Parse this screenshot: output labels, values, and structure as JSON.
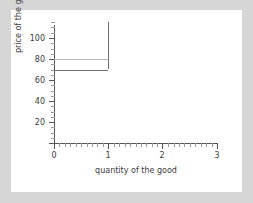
{
  "figure": {
    "background_color": "#d6d6d6",
    "panel_color": "#ffffff"
  },
  "chart_data": {
    "type": "line",
    "title": "",
    "xlabel": "quantity of the good",
    "ylabel": "price of the good",
    "xlim": [
      0,
      3
    ],
    "ylim": [
      0,
      115
    ],
    "xticks": [
      0,
      1,
      2,
      3
    ],
    "xtick_labels": [
      "0",
      "1",
      "2",
      "3"
    ],
    "yticks": [
      20,
      40,
      60,
      80,
      100
    ],
    "ytick_labels": [
      "20",
      "40",
      "60",
      "80",
      "100"
    ],
    "grid": false,
    "legend": null,
    "series": [
      {
        "name": "demand",
        "color": "#b9b9b9",
        "style": "step",
        "points": [
          [
            0,
            80
          ],
          [
            1,
            80
          ]
        ],
        "values": [
          80,
          80
        ]
      },
      {
        "name": "supply",
        "color": "#6e6e6e",
        "style": "step",
        "points": [
          [
            0,
            70
          ],
          [
            1,
            70
          ],
          [
            1,
            115
          ]
        ],
        "values": [
          70,
          70,
          115
        ]
      }
    ],
    "annotations": []
  },
  "axes": {
    "x_title": "quantity of the good",
    "y_title": "price of the good",
    "xtick_0": "0",
    "xtick_1": "1",
    "xtick_2": "2",
    "xtick_3": "3",
    "ytick_20": "20",
    "ytick_40": "40",
    "ytick_60": "60",
    "ytick_80": "80",
    "ytick_100": "100"
  }
}
